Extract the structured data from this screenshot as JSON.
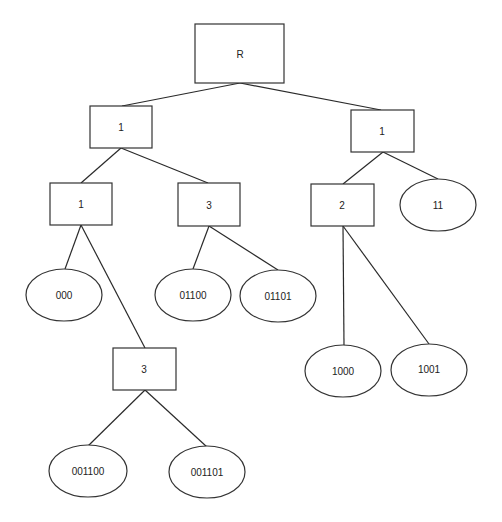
{
  "diagram": {
    "type": "tree",
    "nodes": {
      "root": {
        "label": "R",
        "shape": "rect"
      },
      "l1": {
        "label": "1",
        "shape": "rect"
      },
      "r1": {
        "label": "1",
        "shape": "rect"
      },
      "l1_l": {
        "label": "1",
        "shape": "rect"
      },
      "l1_r": {
        "label": "3",
        "shape": "rect"
      },
      "r1_l": {
        "label": "2",
        "shape": "rect"
      },
      "r1_r": {
        "label": "11",
        "shape": "ellipse"
      },
      "leaf_000": {
        "label": "000",
        "shape": "ellipse"
      },
      "deep3": {
        "label": "3",
        "shape": "rect"
      },
      "leaf_01100": {
        "label": "01100",
        "shape": "ellipse"
      },
      "leaf_01101": {
        "label": "01101",
        "shape": "ellipse"
      },
      "leaf_1000": {
        "label": "1000",
        "shape": "ellipse"
      },
      "leaf_1001": {
        "label": "1001",
        "shape": "ellipse"
      },
      "leaf_001100": {
        "label": "001100",
        "shape": "ellipse"
      },
      "leaf_001101": {
        "label": "001101",
        "shape": "ellipse"
      }
    },
    "edges": [
      [
        "root",
        "l1"
      ],
      [
        "root",
        "r1"
      ],
      [
        "l1",
        "l1_l"
      ],
      [
        "l1",
        "l1_r"
      ],
      [
        "r1",
        "r1_l"
      ],
      [
        "r1",
        "r1_r"
      ],
      [
        "l1_l",
        "leaf_000"
      ],
      [
        "l1_l",
        "deep3"
      ],
      [
        "l1_r",
        "leaf_01100"
      ],
      [
        "l1_r",
        "leaf_01101"
      ],
      [
        "r1_l",
        "leaf_1000"
      ],
      [
        "r1_l",
        "leaf_1001"
      ],
      [
        "deep3",
        "leaf_001100"
      ],
      [
        "deep3",
        "leaf_001101"
      ]
    ]
  }
}
